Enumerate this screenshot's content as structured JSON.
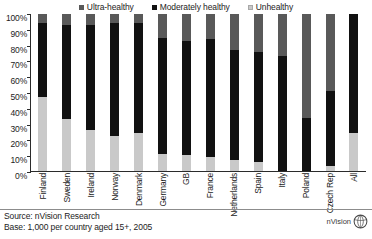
{
  "chart_data": {
    "type": "bar",
    "subtype": "100% stacked column",
    "title": "",
    "xlabel": "",
    "ylabel": "",
    "ylim": [
      0,
      100
    ],
    "ytick_labels": [
      "100%",
      "90%",
      "80%",
      "70%",
      "60%",
      "50%",
      "40%",
      "30%",
      "20%",
      "10%",
      "0%"
    ],
    "ytick_values": [
      100,
      90,
      80,
      70,
      60,
      50,
      40,
      30,
      20,
      10,
      0
    ],
    "grid": false,
    "legend_position": "top-center",
    "categories": [
      "Finland",
      "Sweden",
      "Ireland",
      "Norway",
      "Denmark",
      "Germany",
      "GB",
      "France",
      "Netherlands",
      "Spain",
      "Italy",
      "Poland",
      "Czech Rep",
      "All"
    ],
    "series": [
      {
        "name": "Ultra-healthy",
        "color": "#595959",
        "values": [
          6,
          7,
          7,
          6,
          6,
          15,
          17,
          16,
          23,
          24,
          27,
          66,
          49,
          0
        ]
      },
      {
        "name": "Moderately healthy",
        "color": "#111111",
        "values": [
          47,
          60,
          67,
          72,
          70,
          74,
          73,
          75,
          70,
          70,
          73,
          34,
          48,
          76
        ]
      },
      {
        "name": "Unhealthy",
        "color": "#c9c9c9",
        "values": [
          47,
          33,
          26,
          22,
          24,
          11,
          10,
          9,
          7,
          6,
          0,
          0,
          3,
          24
        ]
      }
    ],
    "annotations": {
      "source": "Source: nVision Research",
      "base": "Base: 1,000 per country aged 15+, 2005"
    }
  },
  "legend": {
    "items": [
      {
        "label": "Ultra-healthy",
        "color": "#595959",
        "swatch": "square-swatch"
      },
      {
        "label": "Moderately healthy",
        "color": "#111111",
        "swatch": "square-swatch"
      },
      {
        "label": "Unhealthy",
        "color": "#c9c9c9",
        "swatch": "square-swatch"
      }
    ]
  },
  "footer": {
    "source_line": "Source: nVision Research",
    "base_line": "Base: 1,000 per country aged 15+, 2005",
    "logo_text": "nVision"
  }
}
